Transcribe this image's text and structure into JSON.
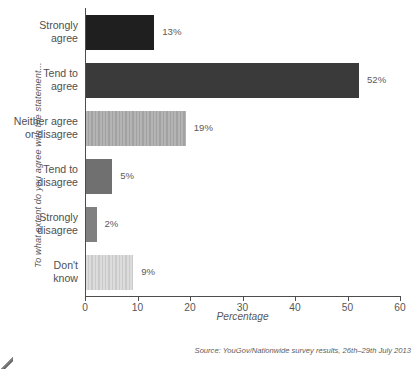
{
  "chart_data": {
    "type": "bar",
    "orientation": "horizontal",
    "title": "",
    "xlabel": "Percentage",
    "ylabel": "To what extent do you agree with the statement...",
    "categories": [
      "Strongly\nagree",
      "Tend to\nagree",
      "Neither agree\nor disagree",
      "Tend to\ndisagree",
      "Strongly\ndisagree",
      "Don't\nknow"
    ],
    "values": [
      13,
      52,
      19,
      5,
      2,
      9
    ],
    "value_labels": [
      "13%",
      "52%",
      "19%",
      "5%",
      "2%",
      "9%"
    ],
    "bar_colors": [
      "#1f1f1f",
      "#3a3a3a",
      "#b4b4b4",
      "#707070",
      "#808080",
      "#dcdcdc"
    ],
    "bar_patterns": [
      "solid",
      "solid",
      "vertical-stripes",
      "solid",
      "solid",
      "vertical-stripes"
    ],
    "xlim": [
      0,
      60
    ],
    "xticks": [
      0,
      10,
      20,
      30,
      40,
      50,
      60
    ],
    "xtick_labels": [
      "0",
      "10",
      "20",
      "30",
      "40",
      "50",
      "60"
    ],
    "grid": false,
    "legend": false,
    "source": "Source: YouGov/Nationwide survey results, 26th–29th July 2013"
  }
}
